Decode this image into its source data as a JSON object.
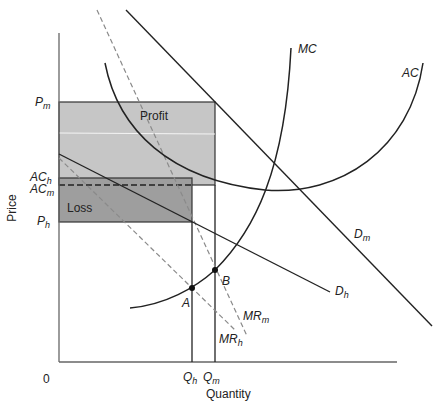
{
  "axes": {
    "x_label": "Quantity",
    "y_label": "Price",
    "origin_label": "0"
  },
  "price_levels": [
    {
      "id": "Pm",
      "main": "P",
      "sub": "m"
    },
    {
      "id": "ACh",
      "main": "AC",
      "sub": "h"
    },
    {
      "id": "ACm",
      "main": "AC",
      "sub": "m"
    },
    {
      "id": "Ph",
      "main": "P",
      "sub": "h"
    }
  ],
  "quantity_levels": [
    {
      "id": "Qh",
      "main": "Q",
      "sub": "h"
    },
    {
      "id": "Qm",
      "main": "Q",
      "sub": "m"
    }
  ],
  "curves": {
    "MC": {
      "main": "MC",
      "sub": ""
    },
    "AC": {
      "main": "AC",
      "sub": ""
    },
    "Dm": {
      "main": "D",
      "sub": "m"
    },
    "Dh": {
      "main": "D",
      "sub": "h"
    },
    "MRm": {
      "main": "MR",
      "sub": "m"
    },
    "MRh": {
      "main": "MR",
      "sub": "h"
    }
  },
  "points": {
    "A": "A",
    "B": "B"
  },
  "regions": {
    "profit": {
      "label": "Profit",
      "color": "#c6c6c6"
    },
    "loss": {
      "label": "Loss",
      "color": "#9e9e9e"
    }
  },
  "colors": {
    "line": "#222222",
    "dashed": "#8a8a8a",
    "axis": "#666666"
  }
}
